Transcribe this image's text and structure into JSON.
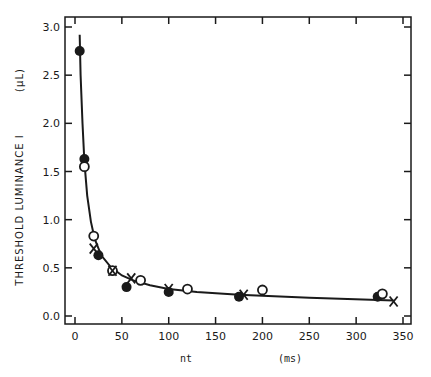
{
  "chart_data": {
    "type": "scatter",
    "title": "",
    "xlabel": "nt",
    "xunit": "(ms)",
    "ylabel": "THRESHOLD LUMINANCE  I",
    "yunit": "(µL)",
    "xlim": [
      0,
      350
    ],
    "ylim": [
      0.0,
      3.0
    ],
    "xticks": [
      0,
      50,
      100,
      150,
      200,
      250,
      300,
      350
    ],
    "xtick_labels": [
      "0",
      "50",
      "100",
      "150",
      "200",
      "250",
      "300",
      "350"
    ],
    "yticks": [
      0.0,
      0.5,
      1.0,
      1.5,
      2.0,
      2.5,
      3.0
    ],
    "ytick_labels": [
      "0.0",
      "0.5",
      "1.0",
      "1.5",
      "2.0",
      "2.5",
      "3.0"
    ],
    "grid": false,
    "legend": null,
    "series": [
      {
        "name": "filled circles",
        "marker": "filled-circle",
        "points": [
          [
            5,
            2.75
          ],
          [
            10,
            1.63
          ],
          [
            25,
            0.63
          ],
          [
            55,
            0.3
          ],
          [
            100,
            0.25
          ],
          [
            175,
            0.2
          ],
          [
            323,
            0.2
          ]
        ]
      },
      {
        "name": "open circles",
        "marker": "open-circle",
        "points": [
          [
            10,
            1.55
          ],
          [
            20,
            0.83
          ],
          [
            40,
            0.47
          ],
          [
            70,
            0.37
          ],
          [
            120,
            0.28
          ],
          [
            200,
            0.27
          ],
          [
            328,
            0.23
          ]
        ]
      },
      {
        "name": "crosses",
        "marker": "x",
        "points": [
          [
            20,
            0.7
          ],
          [
            40,
            0.47
          ],
          [
            60,
            0.39
          ],
          [
            100,
            0.28
          ],
          [
            180,
            0.22
          ],
          [
            340,
            0.15
          ]
        ]
      }
    ],
    "fit_curve": {
      "name": "fitted curve",
      "points": [
        [
          5,
          2.92
        ],
        [
          6,
          2.5
        ],
        [
          8,
          2.0
        ],
        [
          10,
          1.6
        ],
        [
          13,
          1.25
        ],
        [
          17,
          0.98
        ],
        [
          21,
          0.8
        ],
        [
          28,
          0.63
        ],
        [
          38,
          0.51
        ],
        [
          50,
          0.42
        ],
        [
          62,
          0.37
        ],
        [
          80,
          0.32
        ],
        [
          100,
          0.28
        ],
        [
          130,
          0.25
        ],
        [
          175,
          0.22
        ],
        [
          250,
          0.19
        ],
        [
          340,
          0.16
        ]
      ]
    }
  }
}
